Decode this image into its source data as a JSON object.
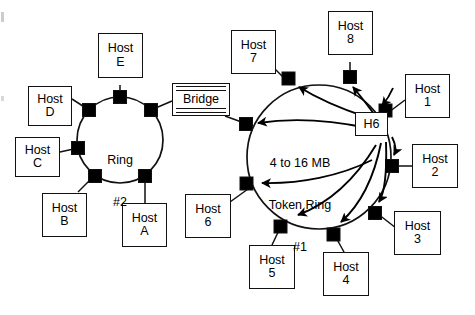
{
  "diagram": {
    "title_hidden": "Token Ring network with bridge",
    "rings": [
      {
        "id": "ring2",
        "caption_lines": [
          "Ring",
          "#2"
        ],
        "cx": 120,
        "cy": 140,
        "r": 43,
        "nodes": 6
      },
      {
        "id": "ring1",
        "caption_lines": [
          "4 to 16 MB",
          "Token Ring",
          "#1"
        ],
        "cx": 319,
        "cy": 157,
        "r": 72,
        "nodes": 8
      }
    ],
    "bridge": {
      "label": "Bridge"
    },
    "hosts_ring2": [
      {
        "name": "host-d",
        "l1": "Host",
        "l2": "D"
      },
      {
        "name": "host-e",
        "l1": "Host",
        "l2": "E"
      },
      {
        "name": "host-c",
        "l1": "Host",
        "l2": "C"
      },
      {
        "name": "host-b",
        "l1": "Host",
        "l2": "B"
      },
      {
        "name": "host-a",
        "l1": "Host",
        "l2": "A"
      }
    ],
    "hosts_ring1": [
      {
        "name": "host-7",
        "l1": "Host",
        "l2": "7"
      },
      {
        "name": "host-8",
        "l1": "Host",
        "l2": "8"
      },
      {
        "name": "host-1",
        "l1": "Host",
        "l2": "1"
      },
      {
        "name": "host-2",
        "l1": "Host",
        "l2": "2"
      },
      {
        "name": "host-3",
        "l1": "Host",
        "l2": "3"
      },
      {
        "name": "host-4",
        "l1": "Host",
        "l2": "4"
      },
      {
        "name": "host-5",
        "l1": "Host",
        "l2": "5"
      },
      {
        "name": "host-6",
        "l1": "Host",
        "l2": "6"
      }
    ],
    "source_host": {
      "label": "H6"
    },
    "colors": {
      "stroke": "#111111",
      "node_fill": "#000000",
      "background": "#ffffff",
      "text": "#000000"
    }
  }
}
